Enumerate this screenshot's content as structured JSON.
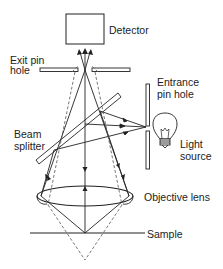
{
  "diagram": {
    "labels": {
      "detector": "Detector",
      "exit_pin_hole_1": "Exit pin",
      "exit_pin_hole_2": "hole",
      "entrance_pin_hole_1": "Entrance",
      "entrance_pin_hole_2": "pin hole",
      "beam_splitter_1": "Beam",
      "beam_splitter_2": "splitter",
      "light_source_1": "Light",
      "light_source_2": "source",
      "objective_lens": "Objective lens",
      "sample": "Sample"
    },
    "colors": {
      "line": "#222222",
      "dashed": "#555555",
      "background": "#ffffff"
    }
  }
}
